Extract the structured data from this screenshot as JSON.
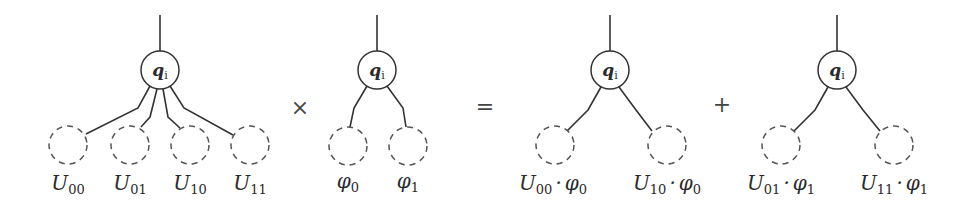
{
  "diagram": {
    "root_label": {
      "base": "q",
      "sub": "i"
    },
    "operators": {
      "times": "×",
      "equals": "=",
      "plus": "+"
    },
    "panels": [
      {
        "name": "U-tree",
        "leaves": [
          {
            "base": "U",
            "sub": "00",
            "suffix": ""
          },
          {
            "base": "U",
            "sub": "01",
            "suffix": ""
          },
          {
            "base": "U",
            "sub": "10",
            "suffix": ""
          },
          {
            "base": "U",
            "sub": "11",
            "suffix": ""
          }
        ]
      },
      {
        "name": "phi-tree",
        "leaves": [
          {
            "base": "φ",
            "sub": "0",
            "suffix": ""
          },
          {
            "base": "φ",
            "sub": "1",
            "suffix": ""
          }
        ]
      },
      {
        "name": "result-tree-0",
        "leaves": [
          {
            "base": "U",
            "sub": "00",
            "dot": "·",
            "base2": "φ",
            "sub2": "0"
          },
          {
            "base": "U",
            "sub": "10",
            "dot": "·",
            "base2": "φ",
            "sub2": "0"
          }
        ]
      },
      {
        "name": "result-tree-1",
        "leaves": [
          {
            "base": "U",
            "sub": "01",
            "dot": "·",
            "base2": "φ",
            "sub2": "1"
          },
          {
            "base": "U",
            "sub": "11",
            "dot": "·",
            "base2": "φ",
            "sub2": "1"
          }
        ]
      }
    ]
  }
}
